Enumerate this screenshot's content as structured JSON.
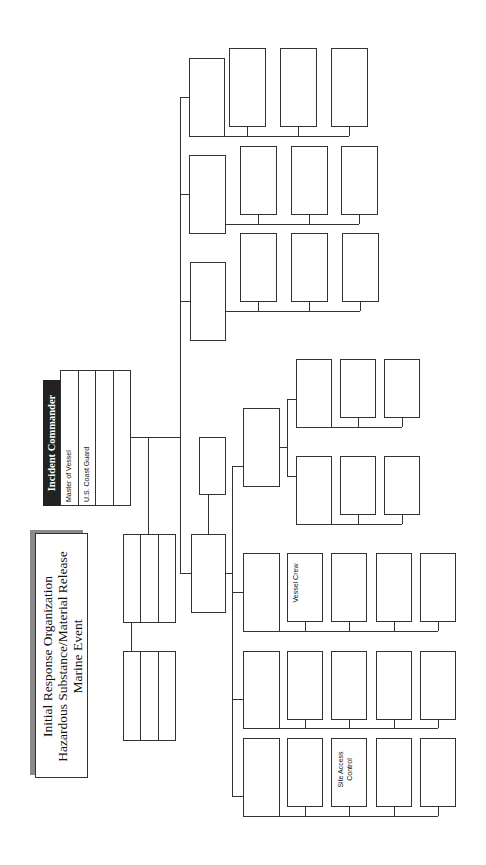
{
  "title": {
    "lines": [
      "Initial Response Organization",
      "Hazardous Substance/Material Release",
      "Marine Event"
    ]
  },
  "incident_commander": {
    "header": "Incident Commander",
    "rows": [
      "Master of Vessel",
      "U.S. Coast Guard",
      "",
      ""
    ]
  },
  "box_labels": {
    "vessel_crew": "Vessel Crew",
    "site_access_control": "Site Access Control"
  },
  "colors": {
    "line": "#333333",
    "header_bg": "#222222",
    "shadow": "#8a8a8a"
  }
}
